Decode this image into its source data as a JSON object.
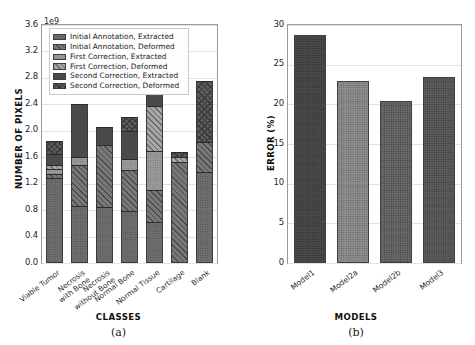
{
  "figure": {
    "panels": [
      {
        "caption": "(a)",
        "xlabel": "CLASSES",
        "ylabel": "NUMBER OF PIXELS",
        "offset_text": "1e9"
      },
      {
        "caption": "(b)",
        "xlabel": "MODELS",
        "ylabel": "ERROR (%)",
        "offset_text": ""
      }
    ]
  },
  "chart_data": [
    {
      "type": "bar",
      "subplot": "(a)",
      "stacked": true,
      "title": "",
      "xlabel": "CLASSES",
      "ylabel": "NUMBER OF PIXELS",
      "y_offset_multiplier": "1e9",
      "ylim": [
        0.0,
        3.6
      ],
      "yticks": [
        "0.0",
        "0.4",
        "0.8",
        "1.2",
        "1.6",
        "2.0",
        "2.4",
        "2.8",
        "3.2",
        "3.6"
      ],
      "ytick_values": [
        0.0,
        0.4,
        0.8,
        1.2,
        1.6,
        2.0,
        2.4,
        2.8,
        3.2,
        3.6
      ],
      "grid": true,
      "legend_position": "upper left",
      "categories": [
        "Viable Tumor",
        "Necrosis\nwith Bone",
        "Necrosis\nwithout Bone",
        "Normal Bone",
        "Normal Tissue",
        "Cartilage",
        "Blank"
      ],
      "series": [
        {
          "name": "Initial Annotation, Extracted",
          "fill": "tx-dot",
          "values": [
            1.29,
            0.86,
            0.84,
            0.78,
            0.62,
            0.0,
            1.37
          ]
        },
        {
          "name": "Initial Annotation, Deformed",
          "fill": "tx-diag",
          "values": [
            0.05,
            0.62,
            0.95,
            0.62,
            0.48,
            1.53,
            0.46
          ]
        },
        {
          "name": "First Correction, Extracted",
          "fill": "tx-dot-light",
          "values": [
            0.08,
            0.13,
            0.0,
            0.18,
            0.59,
            0.0,
            0.0
          ]
        },
        {
          "name": "First Correction, Deformed",
          "fill": "tx-diag-light",
          "values": [
            0.06,
            0.0,
            0.0,
            0.0,
            0.69,
            0.07,
            0.0
          ]
        },
        {
          "name": "Second Correction, Extracted",
          "fill": "tx-plain-dark",
          "values": [
            0.17,
            0.79,
            0.27,
            0.42,
            0.43,
            0.0,
            0.0
          ]
        },
        {
          "name": "Second Correction, Deformed",
          "fill": "tx-cross",
          "values": [
            0.2,
            0.0,
            0.0,
            0.21,
            0.4,
            0.08,
            0.93
          ]
        }
      ],
      "totals": [
        1.85,
        2.4,
        2.06,
        2.21,
        3.21,
        1.68,
        2.76
      ]
    },
    {
      "type": "bar",
      "subplot": "(b)",
      "stacked": false,
      "title": "",
      "xlabel": "MODELS",
      "ylabel": "ERROR (%)",
      "ylim": [
        0,
        30
      ],
      "yticks": [
        "0",
        "5",
        "10",
        "15",
        "20",
        "25",
        "30"
      ],
      "ytick_values": [
        0,
        5,
        10,
        15,
        20,
        25,
        30
      ],
      "grid": true,
      "legend_position": "none",
      "categories": [
        "Model1",
        "Model2a",
        "Model2b",
        "Model3"
      ],
      "values": [
        28.7,
        23.0,
        20.4,
        23.4
      ]
    }
  ],
  "legend": {
    "items": [
      {
        "label": "Initial Annotation, Extracted",
        "swatch": "tx-dot"
      },
      {
        "label": "Initial Annotation, Deformed",
        "swatch": "tx-diag"
      },
      {
        "label": "First Correction, Extracted",
        "swatch": "tx-dot-light"
      },
      {
        "label": "First Correction, Deformed",
        "swatch": "tx-diag-light"
      },
      {
        "label": "Second Correction, Extracted",
        "swatch": "tx-plain-dark"
      },
      {
        "label": "Second Correction, Deformed",
        "swatch": "tx-cross"
      }
    ]
  }
}
